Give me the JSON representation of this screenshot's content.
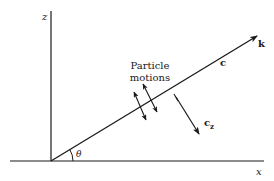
{
  "diagram": {
    "type": "wave-propagation-geometry",
    "axes": {
      "vertical_label": "z",
      "horizontal_label": "x"
    },
    "wave_vector_label": "k",
    "phase_velocity_label": "c",
    "vertical_velocity_label": "c",
    "vertical_velocity_subscript": "z",
    "angle_label": "θ",
    "particle_motion_label_line1": "Particle",
    "particle_motion_label_line2": "motions",
    "colors": {
      "ink": "#1a1a1a",
      "background": "#ffffff"
    }
  }
}
